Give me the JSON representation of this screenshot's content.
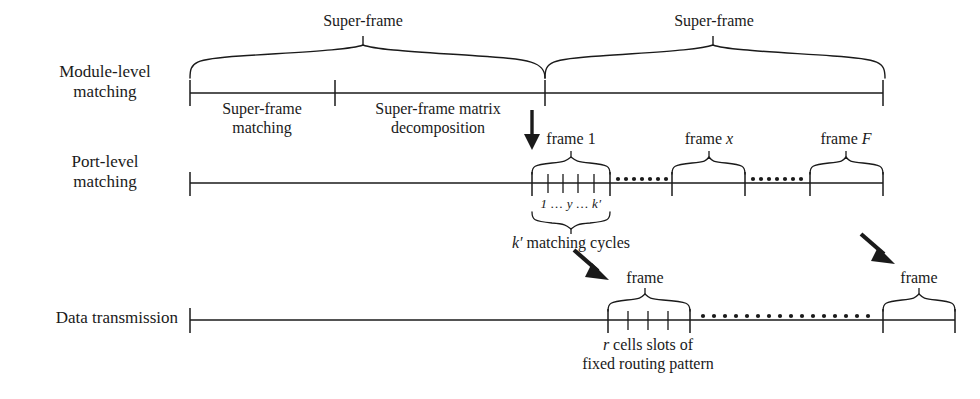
{
  "figure": {
    "type": "timing-hierarchy-diagram",
    "background_color": "#ffffff",
    "stroke_color": "#1a1a1a"
  },
  "rows": [
    {
      "id": "module-level",
      "label_line1": "Module-level",
      "label_line2": "matching",
      "timeline": {
        "x_start": 190,
        "x_end": 883,
        "y": 93
      },
      "ticks": [
        190,
        335,
        545,
        883
      ],
      "segments": [
        {
          "label_line1": "Super-frame",
          "label_line2": "matching",
          "x_from": 190,
          "x_to": 335
        },
        {
          "label_line1": "Super-frame matrix",
          "label_line2": "decomposition",
          "x_from": 335,
          "x_to": 545
        }
      ],
      "braces": [
        {
          "label": "Super-frame",
          "x_from": 190,
          "x_to": 545
        },
        {
          "label": "Super-frame",
          "x_from": 545,
          "x_to": 885
        }
      ]
    },
    {
      "id": "port-level",
      "label_line1": "Port-level",
      "label_line2": "matching",
      "timeline": {
        "x_start": 190,
        "x_end": 883,
        "y": 183
      },
      "ticks": [
        190,
        532,
        610,
        672,
        745,
        810,
        883
      ],
      "frames": [
        {
          "label": "frame 1",
          "label_italic": "",
          "x_from": 532,
          "x_to": 610,
          "subticks": [
            548,
            563,
            578,
            594
          ]
        },
        {
          "label": "frame ",
          "label_italic": "x",
          "x_from": 672,
          "x_to": 745,
          "subticks": []
        },
        {
          "label": "frame ",
          "label_italic": "F",
          "x_from": 810,
          "x_to": 883,
          "subticks": []
        }
      ],
      "ellipses": [
        {
          "x_from": 616,
          "x_to": 666,
          "count": 7
        },
        {
          "x_from": 752,
          "x_to": 804,
          "count": 7
        }
      ],
      "cycle_numbers": "1 … y … k′",
      "cycle_caption_italic": "k′",
      "cycle_caption_rest": " matching cycles",
      "cycle_brace": {
        "x_from": 532,
        "x_to": 610
      }
    },
    {
      "id": "data-transmission",
      "label_line1": "Data transmission",
      "label_line2": "",
      "timeline": {
        "x_start": 190,
        "x_end": 955,
        "y": 320
      },
      "ticks": [
        608,
        690,
        883,
        955
      ],
      "frames": [
        {
          "label": "frame",
          "x_from": 608,
          "x_to": 690,
          "subticks": [
            628,
            648,
            668
          ]
        },
        {
          "label": "frame",
          "x_from": 883,
          "x_to": 955,
          "subticks": []
        }
      ],
      "ellipses": [
        {
          "x_from": 700,
          "x_to": 875,
          "count": 16
        }
      ],
      "caption_line1_italic": "r",
      "caption_line1_rest": " cells slots of",
      "caption_line2": "fixed routing pattern"
    }
  ],
  "arrows": [
    {
      "name": "decomposition-arrow",
      "kind": "down",
      "x1": 532,
      "y1": 110,
      "x2": 532,
      "y2": 148
    },
    {
      "name": "frame1-to-data-arrow",
      "kind": "diagonal",
      "x1": 576,
      "y1": 252,
      "x2": 607,
      "y2": 279
    },
    {
      "name": "frameF-to-data-arrow",
      "kind": "diagonal",
      "x1": 862,
      "y1": 236,
      "x2": 893,
      "y2": 263
    }
  ],
  "text": {
    "module_level_label_1": "Module-level",
    "module_level_label_2": "matching",
    "port_level_label_1": "Port-level",
    "port_level_label_2": "matching",
    "data_transmission_label": "Data transmission",
    "super_frame_1": "Super-frame",
    "super_frame_2": "Super-frame",
    "super_frame_matching_1": "Super-frame",
    "super_frame_matching_2": "matching",
    "super_frame_matrix_1": "Super-frame matrix",
    "super_frame_matrix_2": "decomposition",
    "frame_1": "frame 1",
    "frame_x_prefix": "frame ",
    "frame_x_var": "x",
    "frame_F_prefix": "frame ",
    "frame_F_var": "F",
    "cycle_numbers": "1 … y … k′",
    "cycle_caption_var": "k′",
    "cycle_caption_rest": " matching cycles",
    "data_frame_left": "frame",
    "data_frame_right": "frame",
    "cells_caption_var": "r",
    "cells_caption_rest": " cells slots of",
    "routing_caption": "fixed routing pattern"
  }
}
